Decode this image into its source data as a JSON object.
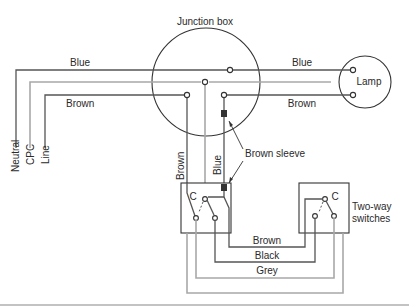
{
  "diagram": {
    "title": "Junction box",
    "lamp_label": "Lamp",
    "switches_label_line1": "Two-way",
    "switches_label_line2": "switches",
    "supply_labels": {
      "neutral": "Neutral",
      "cpc": "CPC",
      "line": "Line"
    },
    "wire_labels": {
      "supply_blue": "Blue",
      "supply_brown": "Brown",
      "lamp_blue": "Blue",
      "lamp_brown": "Brown",
      "drop_brown": "Brown",
      "drop_blue": "Blue",
      "sleeve": "Brown sleeve",
      "strapper_brown": "Brown",
      "strapper_black": "Black",
      "strapper_grey": "Grey"
    },
    "switch_common_left": "C",
    "switch_common_right": "C",
    "colors": {
      "conductor": "#555555",
      "cpc": "#a8a8a8",
      "outline": "#333333",
      "sleeve": "#333333"
    }
  }
}
